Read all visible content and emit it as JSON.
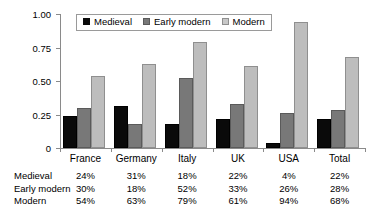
{
  "chart_data": {
    "type": "bar",
    "title": "",
    "xlabel": "",
    "ylabel": "",
    "ylim": [
      0,
      1.0
    ],
    "grid": false,
    "legend_position": "top-center",
    "categories": [
      "France",
      "Germany",
      "Italy",
      "UK",
      "USA",
      "Total"
    ],
    "ytick_labels": [
      "1.00",
      "0.75",
      "0.50",
      "0.25",
      "0"
    ],
    "ytick_values": [
      1.0,
      0.75,
      0.5,
      0.25,
      0
    ],
    "series": [
      {
        "name": "Medieval",
        "color": "#0a0a0a",
        "values": [
          0.24,
          0.31,
          0.18,
          0.22,
          0.04,
          0.22
        ]
      },
      {
        "name": "Early modern",
        "color": "#787878",
        "values": [
          0.3,
          0.18,
          0.52,
          0.33,
          0.26,
          0.28
        ]
      },
      {
        "name": "Modern",
        "color": "#bdbdbd",
        "values": [
          0.54,
          0.63,
          0.79,
          0.61,
          0.94,
          0.68
        ]
      }
    ],
    "table": {
      "column_headers": [
        "France",
        "Germany",
        "Italy",
        "UK",
        "USA",
        "Total"
      ],
      "rows": [
        {
          "label": "Medieval",
          "values": [
            "24%",
            "31%",
            "18%",
            "22%",
            "4%",
            "22%"
          ]
        },
        {
          "label": "Early modern",
          "values": [
            "30%",
            "18%",
            "52%",
            "33%",
            "26%",
            "28%"
          ]
        },
        {
          "label": "Modern",
          "values": [
            "54%",
            "63%",
            "79%",
            "61%",
            "94%",
            "68%"
          ]
        }
      ]
    }
  }
}
